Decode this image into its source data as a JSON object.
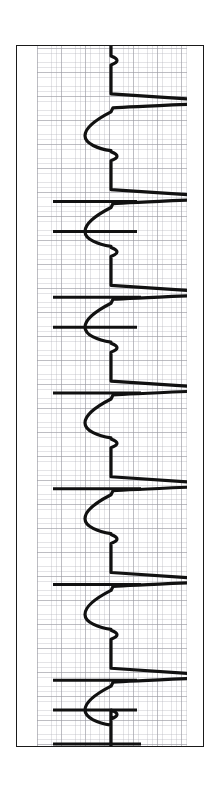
{
  "page": {
    "background_color": "#ffffff",
    "width": 221,
    "height": 792
  },
  "top_caption": {
    "text": "",
    "note": "cropped / illegible text fragment at top edge"
  },
  "ecg": {
    "title": "",
    "frame": {
      "border_color": "#1a1a1a",
      "background_color": "#ffffff",
      "left": 16,
      "top": 45,
      "width": 188,
      "height": 702
    },
    "paper": {
      "major_grid_color": "#96969e",
      "minor_grid_color": "#b0b0b8",
      "major_grid_px": 24,
      "minor_grid_px": 4.8
    },
    "trace": {
      "color": "#111111",
      "stroke_width": 3.2,
      "orientation": "vertical",
      "baseline_x_px": 74,
      "beat_count": 8,
      "beat_period_px": 96,
      "first_beat_offset_px": -40
    },
    "calipers": {
      "color": "#111111",
      "stroke_width": 3.0,
      "count_per_beat": 2
    }
  },
  "chart_data": {
    "type": "line",
    "title": "",
    "subtitle": "",
    "xlabel": "",
    "ylabel": "",
    "orientation": "vertical-strip",
    "legend": [],
    "grid": true,
    "axis_note": "ECG rhythm strip rotated 90 degrees; time advances downward, amplitude deflects to the right",
    "xlim": [
      0,
      150
    ],
    "ylim": [
      0,
      702
    ],
    "series": [
      {
        "name": "ECG lead trace",
        "color": "#111111",
        "description": "Repeating sinus-like complexes: P wave bump, tall narrow QRS spike, broad T wave"
      }
    ],
    "beats": [
      {
        "index": 1,
        "qrs_time_px": 56,
        "qrs_amplitude_px": 94,
        "t_wave_amplitude_px": -26,
        "p_wave_amplitude_px": 8,
        "caliper_lines": 1
      },
      {
        "index": 2,
        "qrs_time_px": 152,
        "qrs_amplitude_px": 94,
        "t_wave_amplitude_px": -26,
        "p_wave_amplitude_px": 8,
        "caliper_lines": 2
      },
      {
        "index": 3,
        "qrs_time_px": 248,
        "qrs_amplitude_px": 94,
        "t_wave_amplitude_px": -26,
        "p_wave_amplitude_px": 8,
        "caliper_lines": 2
      },
      {
        "index": 4,
        "qrs_time_px": 344,
        "qrs_amplitude_px": 94,
        "t_wave_amplitude_px": -26,
        "p_wave_amplitude_px": 8,
        "caliper_lines": 1
      },
      {
        "index": 5,
        "qrs_time_px": 440,
        "qrs_amplitude_px": 94,
        "t_wave_amplitude_px": -26,
        "p_wave_amplitude_px": 8,
        "caliper_lines": 1
      },
      {
        "index": 6,
        "qrs_time_px": 536,
        "qrs_amplitude_px": 94,
        "t_wave_amplitude_px": -26,
        "p_wave_amplitude_px": 8,
        "caliper_lines": 1
      },
      {
        "index": 7,
        "qrs_time_px": 632,
        "qrs_amplitude_px": 94,
        "t_wave_amplitude_px": -26,
        "p_wave_amplitude_px": 8,
        "caliper_lines": 2
      },
      {
        "index": 8,
        "qrs_time_px": 712,
        "qrs_amplitude_px": 94,
        "t_wave_amplitude_px": -26,
        "p_wave_amplitude_px": 8,
        "caliper_lines": 0
      }
    ],
    "annotations": [
      {
        "kind": "caliper",
        "label": "",
        "time_px": 156,
        "span_px": [
          16,
          100
        ]
      },
      {
        "kind": "caliper",
        "label": "",
        "time_px": 186,
        "span_px": [
          16,
          100
        ]
      },
      {
        "kind": "caliper",
        "label": "",
        "time_px": 252,
        "span_px": [
          16,
          104
        ]
      },
      {
        "kind": "caliper",
        "label": "",
        "time_px": 282,
        "span_px": [
          16,
          100
        ]
      },
      {
        "kind": "caliper",
        "label": "",
        "time_px": 348,
        "span_px": [
          16,
          104
        ]
      },
      {
        "kind": "caliper",
        "label": "",
        "time_px": 444,
        "span_px": [
          16,
          104
        ]
      },
      {
        "kind": "caliper",
        "label": "",
        "time_px": 540,
        "span_px": [
          16,
          104
        ]
      },
      {
        "kind": "caliper",
        "label": "",
        "time_px": 636,
        "span_px": [
          16,
          100
        ]
      },
      {
        "kind": "caliper",
        "label": "",
        "time_px": 666,
        "span_px": [
          16,
          100
        ]
      },
      {
        "kind": "caliper",
        "label": "",
        "time_px": 700,
        "span_px": [
          16,
          104
        ]
      }
    ]
  }
}
